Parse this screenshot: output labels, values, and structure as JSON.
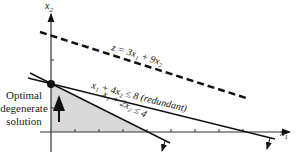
{
  "diagram": {
    "axes": {
      "x_label": "x",
      "x_sub": "1",
      "y_label": "x",
      "y_sub": "2"
    },
    "objective": {
      "label": "z = 3x₁ + 9x₂",
      "style": "dashed"
    },
    "constraints": [
      {
        "label": "x₁ + 4x₂ ≤ 8 (redundant)"
      },
      {
        "label": "x₁ + 2x₂ ≤ 4"
      }
    ],
    "caption_lines": [
      "Optimal",
      "degenerate",
      "solution"
    ],
    "optimal_point": {
      "x1": 0,
      "x2": 2
    },
    "feasible_region_color": "#d9d9d9"
  }
}
